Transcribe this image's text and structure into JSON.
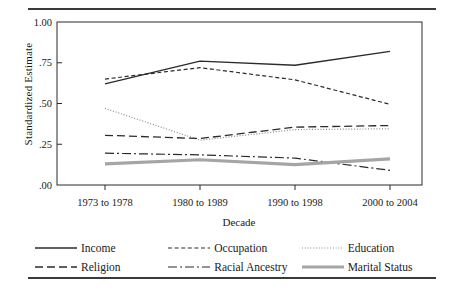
{
  "chart_data": {
    "type": "line",
    "title": "",
    "xlabel": "Decade",
    "ylabel": "Standardized Estimate",
    "categories": [
      "1973 to 1978",
      "1980 to 1989",
      "1990 to 1998",
      "2000 to 2004"
    ],
    "ylim": [
      0,
      1
    ],
    "ytick_labels": [
      "1.00",
      ".75",
      ".50",
      ".25",
      ".00"
    ],
    "ytick_values": [
      1.0,
      0.75,
      0.5,
      0.25,
      0.0
    ],
    "grid": false,
    "legend_position": "bottom",
    "series": [
      {
        "name": "Income",
        "values": [
          0.62,
          0.76,
          0.735,
          0.82
        ],
        "style": "solid",
        "color": "#2b2b2b",
        "width": 1.4
      },
      {
        "name": "Occupation",
        "values": [
          0.65,
          0.72,
          0.645,
          0.495
        ],
        "style": "dashed",
        "color": "#2b2b2b",
        "width": 1.2
      },
      {
        "name": "Education",
        "values": [
          0.47,
          0.275,
          0.34,
          0.345
        ],
        "style": "dotted",
        "color": "#8a8a8a",
        "width": 1.2
      },
      {
        "name": "Religion",
        "values": [
          0.305,
          0.285,
          0.355,
          0.365
        ],
        "style": "longdash",
        "color": "#2b2b2b",
        "width": 1.3
      },
      {
        "name": "Racial Ancestry",
        "values": [
          0.195,
          0.185,
          0.165,
          0.09
        ],
        "style": "dashdot",
        "color": "#2b2b2b",
        "width": 1.2
      },
      {
        "name": "Marital Status",
        "values": [
          0.13,
          0.155,
          0.125,
          0.16
        ],
        "style": "thick",
        "color": "#a5a5a5",
        "width": 3.2
      }
    ]
  },
  "legend": {
    "rows": [
      [
        "Income",
        "Occupation",
        "Education"
      ],
      [
        "Religion",
        "Racial Ancestry",
        "Marital Status"
      ]
    ]
  }
}
